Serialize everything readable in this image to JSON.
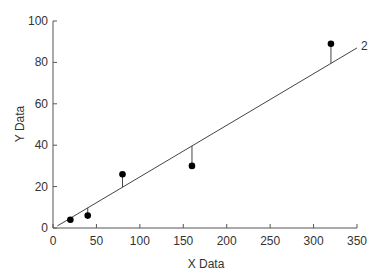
{
  "chart_data": {
    "type": "scatter",
    "title": "",
    "xlabel": "X Data",
    "ylabel": "Y Data",
    "xlim": [
      0,
      350
    ],
    "ylim": [
      0,
      100
    ],
    "xticks": [
      0,
      50,
      100,
      150,
      200,
      250,
      300,
      350
    ],
    "yticks": [
      0,
      20,
      40,
      60,
      80,
      100
    ],
    "grid": false,
    "legend": null,
    "series": [
      {
        "name": "data",
        "marker": "filled-circle",
        "color": "#000000",
        "points": [
          {
            "x": 20,
            "y": 4
          },
          {
            "x": 40,
            "y": 6
          },
          {
            "x": 80,
            "y": 26
          },
          {
            "x": 160,
            "y": 30
          },
          {
            "x": 320,
            "y": 89
          }
        ]
      }
    ],
    "fit_line": {
      "label": "2",
      "x": [
        5,
        350
      ],
      "y": [
        1,
        87
      ],
      "residuals_shown": true
    }
  }
}
